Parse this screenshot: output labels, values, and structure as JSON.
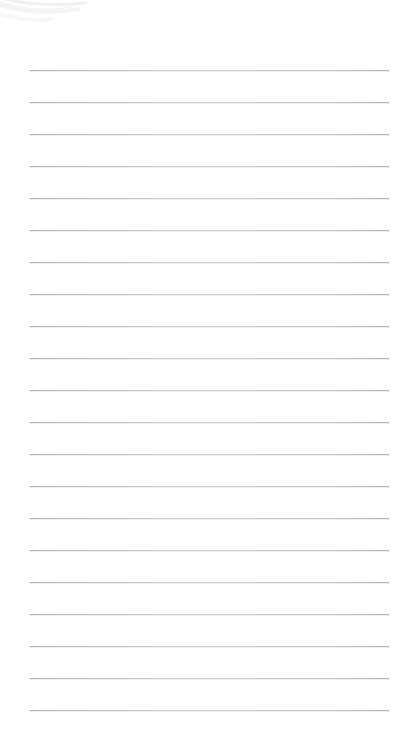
{
  "page": {
    "name": "lined-note-page",
    "width": 420,
    "height": 741,
    "background_color": "#ffffff",
    "content_text": "",
    "is_blank": true
  },
  "ruling": {
    "line_color": "#c4c4c9",
    "line_start_color": "#96969b",
    "line_thickness_px": 1,
    "line_count": 21,
    "first_line_y": 70,
    "line_spacing_px": 32,
    "line_left_x": 30,
    "line_right_x": 389,
    "lines": [
      {
        "index": 1,
        "y": 70
      },
      {
        "index": 2,
        "y": 102
      },
      {
        "index": 3,
        "y": 134
      },
      {
        "index": 4,
        "y": 166
      },
      {
        "index": 5,
        "y": 198
      },
      {
        "index": 6,
        "y": 230
      },
      {
        "index": 7,
        "y": 262
      },
      {
        "index": 8,
        "y": 294
      },
      {
        "index": 9,
        "y": 326
      },
      {
        "index": 10,
        "y": 358
      },
      {
        "index": 11,
        "y": 390
      },
      {
        "index": 12,
        "y": 422
      },
      {
        "index": 13,
        "y": 454
      },
      {
        "index": 14,
        "y": 486
      },
      {
        "index": 15,
        "y": 518
      },
      {
        "index": 16,
        "y": 550
      },
      {
        "index": 17,
        "y": 582
      },
      {
        "index": 18,
        "y": 614
      },
      {
        "index": 19,
        "y": 646
      },
      {
        "index": 20,
        "y": 678
      },
      {
        "index": 21,
        "y": 710
      }
    ]
  },
  "artifacts": {
    "corner_swoosh": {
      "name": "page-curl-swoosh",
      "x": 0,
      "y": 0,
      "width": 96,
      "height": 30,
      "color": "#f2f2f4"
    }
  }
}
